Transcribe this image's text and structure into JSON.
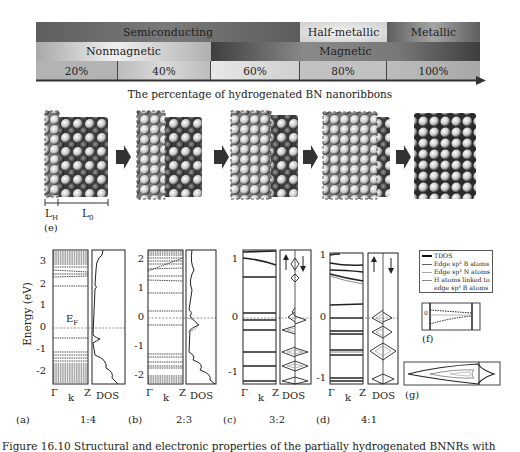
{
  "phase_diagram": {
    "row1": [
      {
        "label": "Semiconducting",
        "x": 36,
        "w": 264
      },
      {
        "label": "Half-metallic",
        "x": 300,
        "w": 87
      },
      {
        "label": "Metallic",
        "x": 387,
        "w": 93
      }
    ],
    "row2": [
      {
        "label": "Nonmagnetic",
        "x": 36,
        "w": 175
      },
      {
        "label": "Magnetic",
        "x": 211,
        "w": 269
      }
    ],
    "percentages": [
      "20%",
      "40%",
      "60%",
      "80%",
      "100%"
    ],
    "axis_caption": "The percentage of hydrogenated BN nanoribbons",
    "colors": {
      "semiconducting": "#6f6f6f",
      "half_metallic": "#d9d9d9",
      "metallic": "#8a8a8a",
      "nonmagnetic": "#c8c8c8",
      "magnetic": "#5a5a5a",
      "percent_row": "#b5b5b5"
    }
  },
  "structures": {
    "count": 5,
    "labels": {
      "lh": "L",
      "lh_sub": "H",
      "l0": "L",
      "l0_sub": "0",
      "panel": "(e)"
    }
  },
  "band_panels": [
    {
      "panel": "(a)",
      "ratio": "1:4",
      "yticks": [
        "3",
        "2",
        "1",
        "0",
        "-1",
        "-2"
      ],
      "ef_label": "E",
      "ef_sub": "F"
    },
    {
      "panel": "(b)",
      "ratio": "2:3",
      "yticks": [
        "2",
        "1",
        "0",
        "-1",
        "-2"
      ]
    },
    {
      "panel": "(c)",
      "ratio": "3:2",
      "yticks": [
        "1",
        "0",
        "-1"
      ]
    },
    {
      "panel": "(d)",
      "ratio": "4:1",
      "yticks": [
        "1",
        "0",
        "-1"
      ]
    }
  ],
  "axis_labels": {
    "ylabel": "Energy (eV)",
    "gamma": "Γ",
    "k": "k",
    "z": "Z",
    "dos": "DOS"
  },
  "legend": {
    "items": [
      {
        "label": "TDOS",
        "color": "#111111",
        "width": 2
      },
      {
        "label": "Edge sp³ B atoms",
        "color": "#666666",
        "width": 1
      },
      {
        "label": "Edge sp³ N atoms",
        "color": "#aaaaaa",
        "width": 1
      },
      {
        "label": "H atoms linked to",
        "color": "#888888",
        "width": 1
      },
      {
        "label": "edge sp³ B atoms",
        "color": "",
        "width": 0
      }
    ]
  },
  "inset_f": {
    "label": "(f)",
    "tick": "0"
  },
  "inset_g": {
    "label": "(g)"
  },
  "figure_caption": "Figure 16.10   Structural and electronic properties of the partially hydrogenated BNNRs with"
}
